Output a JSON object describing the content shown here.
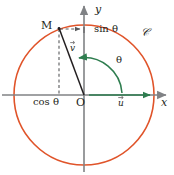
{
  "figure": {
    "colors": {
      "circle": "#e0542a",
      "axis": "#808285",
      "radius": "#231f20",
      "dashed": "#58595b",
      "angle_arc": "#2e7d4f",
      "vector": "#2e7d4f",
      "text": "#231f20",
      "background": "#ffffff"
    },
    "geometry": {
      "center_x": 84,
      "center_y": 95,
      "radius": 70,
      "point_m_x": 59,
      "point_m_y": 29
    }
  },
  "labels": {
    "point_m": "M",
    "origin": "O",
    "axis_y": "y",
    "axis_x": "x",
    "sin_theta": "sin θ",
    "cos_theta": "cos θ",
    "angle_theta": "θ",
    "circle_name": "𝒞",
    "vector_u": "u",
    "vector_v": "v"
  },
  "elements": {
    "circle": "unit-circle",
    "x_axis": "x-axis-arrow",
    "y_axis": "y-axis-arrow",
    "radius_segment": "segment-O-to-M",
    "dashed_vertical": "projection-to-x-axis",
    "dashed_horizontal": "projection-to-y-axis",
    "angle_arc": "angle-arc-theta",
    "unit_vector_u": "unit-vector-u-on-x-axis",
    "unit_vector_v": "unit-vector-v-direction"
  }
}
